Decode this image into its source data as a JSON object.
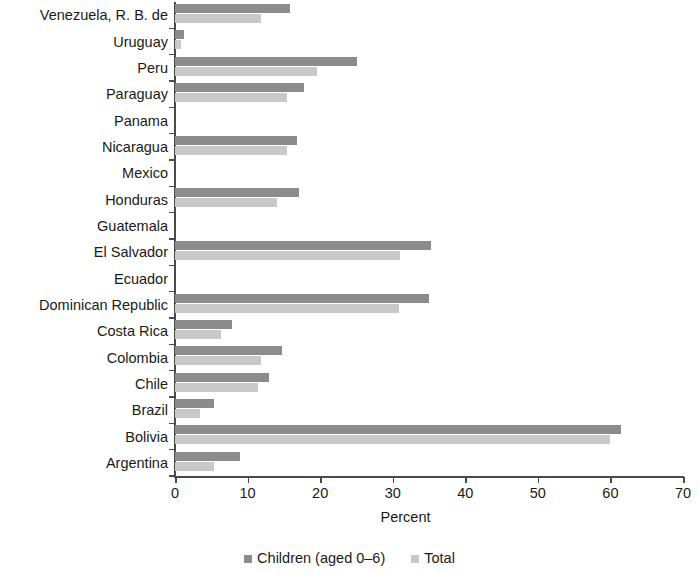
{
  "chart_data": {
    "type": "bar",
    "orientation": "horizontal",
    "title": "",
    "xlabel": "Percent",
    "ylabel": "",
    "xlim": [
      0,
      70
    ],
    "xticks": [
      0,
      10,
      20,
      30,
      40,
      50,
      60,
      70
    ],
    "grid": false,
    "legend_position": "bottom",
    "categories": [
      "Venezuela, R. B. de",
      "Uruguay",
      "Peru",
      "Paraguay",
      "Panama",
      "Nicaragua",
      "Mexico",
      "Honduras",
      "Guatemala",
      "El Salvador",
      "Ecuador",
      "Dominican Republic",
      "Costa Rica",
      "Colombia",
      "Chile",
      "Brazil",
      "Bolivia",
      "Argentina"
    ],
    "series": [
      {
        "name": "Children (aged 0–6)",
        "color": "#8c8c8c",
        "values": [
          15.8,
          1.2,
          25.1,
          17.8,
          0,
          16.8,
          0,
          17.1,
          0,
          35.3,
          0,
          35.0,
          7.8,
          14.8,
          13.0,
          5.4,
          61.5,
          9.0
        ]
      },
      {
        "name": "Total",
        "color": "#c9c9c9",
        "values": [
          11.9,
          0.8,
          19.6,
          15.5,
          0,
          15.5,
          0,
          14.1,
          0,
          31.0,
          0,
          30.9,
          6.3,
          11.9,
          11.4,
          3.4,
          60.0,
          5.4
        ]
      }
    ],
    "legend": [
      "Children (aged 0–6)",
      "Total"
    ]
  },
  "axis": {
    "x_tick_labels": [
      "0",
      "10",
      "20",
      "30",
      "40",
      "50",
      "60",
      "70"
    ],
    "x_title": "Percent"
  },
  "legend": {
    "items": [
      {
        "label": "Children (aged 0–6)",
        "color": "#8c8c8c"
      },
      {
        "label": "Total",
        "color": "#c9c9c9"
      }
    ]
  }
}
